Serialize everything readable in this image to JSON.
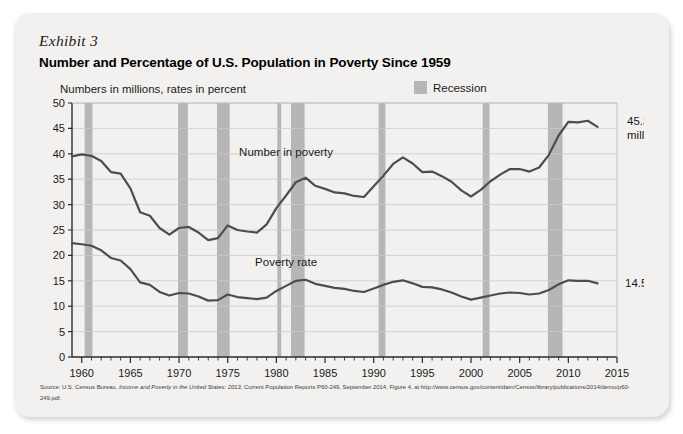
{
  "exhibit": {
    "label": "Exhibit 3",
    "title": "Number and Percentage of U.S. Population in Poverty Since 1959"
  },
  "legend": {
    "recession_label": "Recession",
    "recession_color": "#b6b6b6"
  },
  "source": {
    "prefix": "Source: U.S. Census Bureau, ",
    "italic": "Income and Poverty in the United States: 2013",
    "suffix": ", Current Population Reports P60-249, September 2014, Figure 4, at http://www.census.gov/content/dam/Censss/library/publications/2014/demo/p60-249.pdf."
  },
  "chart_data": {
    "type": "line",
    "title": "Number and Percentage of U.S. Population in Poverty Since 1959",
    "subtitle": "Numbers in millions, rates in percent",
    "xlabel": "",
    "ylabel": "",
    "xlim": [
      1959,
      2015
    ],
    "ylim": [
      0,
      50
    ],
    "ytick_step": 5,
    "yticks": [
      0,
      5,
      10,
      15,
      20,
      25,
      30,
      35,
      40,
      45,
      50
    ],
    "xticks": [
      1960,
      1965,
      1970,
      1975,
      1980,
      1985,
      1990,
      1995,
      2000,
      2005,
      2010,
      2015
    ],
    "xtick_minor_step": 1,
    "grid": "horizontal",
    "legend_position": "top-right",
    "line_color": "#4d4d4d",
    "x": [
      1959,
      1960,
      1961,
      1962,
      1963,
      1964,
      1965,
      1966,
      1967,
      1968,
      1969,
      1970,
      1971,
      1972,
      1973,
      1974,
      1975,
      1976,
      1977,
      1978,
      1979,
      1980,
      1981,
      1982,
      1983,
      1984,
      1985,
      1986,
      1987,
      1988,
      1989,
      1990,
      1991,
      1992,
      1993,
      1994,
      1995,
      1996,
      1997,
      1998,
      1999,
      2000,
      2001,
      2002,
      2003,
      2004,
      2005,
      2006,
      2007,
      2008,
      2009,
      2010,
      2011,
      2012,
      2013
    ],
    "series": [
      {
        "name": "Number in poverty",
        "units": "millions",
        "label_x": 1981,
        "label_y": 39.5,
        "end_label": "45.3 million",
        "end_value": 45.3,
        "values": [
          39.5,
          39.9,
          39.6,
          38.6,
          36.4,
          36.1,
          33.2,
          28.5,
          27.8,
          25.4,
          24.1,
          25.4,
          25.6,
          24.5,
          23.0,
          23.4,
          25.9,
          25.0,
          24.7,
          24.5,
          26.1,
          29.3,
          31.8,
          34.4,
          35.3,
          33.7,
          33.1,
          32.4,
          32.2,
          31.7,
          31.5,
          33.6,
          35.7,
          38.0,
          39.3,
          38.1,
          36.4,
          36.5,
          35.6,
          34.5,
          32.8,
          31.6,
          32.9,
          34.6,
          35.9,
          37.0,
          37.0,
          36.5,
          37.3,
          39.8,
          43.6,
          46.3,
          46.2,
          46.5,
          45.3
        ]
      },
      {
        "name": "Poverty rate",
        "units": "percent",
        "label_x": 1981,
        "label_y": 18.0,
        "end_label": "14.5%",
        "end_value": 14.5,
        "values": [
          22.4,
          22.2,
          21.9,
          21.0,
          19.5,
          19.0,
          17.3,
          14.7,
          14.2,
          12.8,
          12.1,
          12.6,
          12.5,
          11.9,
          11.1,
          11.2,
          12.3,
          11.8,
          11.6,
          11.4,
          11.7,
          13.0,
          14.0,
          15.0,
          15.2,
          14.4,
          14.0,
          13.6,
          13.4,
          13.0,
          12.8,
          13.5,
          14.2,
          14.8,
          15.1,
          14.5,
          13.8,
          13.7,
          13.3,
          12.7,
          11.9,
          11.3,
          11.7,
          12.1,
          12.5,
          12.7,
          12.6,
          12.3,
          12.5,
          13.2,
          14.3,
          15.1,
          15.0,
          15.0,
          14.5
        ]
      }
    ],
    "recessions": [
      {
        "start": 1960.3,
        "end": 1961.1
      },
      {
        "start": 1969.9,
        "end": 1970.9
      },
      {
        "start": 1973.9,
        "end": 1975.2
      },
      {
        "start": 1980.1,
        "end": 1980.5
      },
      {
        "start": 1981.5,
        "end": 1982.9
      },
      {
        "start": 1990.5,
        "end": 1991.2
      },
      {
        "start": 2001.2,
        "end": 2001.9
      },
      {
        "start": 2007.9,
        "end": 2009.4
      }
    ]
  }
}
